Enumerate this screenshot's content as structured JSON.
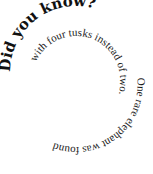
{
  "spiral": {
    "heading": "Did you know?",
    "body_outer": "One rare elephant was found",
    "body_inner": "with four tusks instead of two."
  },
  "colors": {
    "text": "#111111",
    "background": "#ffffff"
  }
}
